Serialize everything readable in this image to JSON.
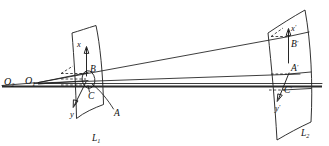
{
  "figure": {
    "kind": "optical-ray-diagram",
    "background_color": "#ffffff",
    "ink_color": "#1b1b1b"
  },
  "labels": {
    "center_far": {
      "base": "O",
      "sub": "2"
    },
    "center_near": {
      "base": "O",
      "sub": "1"
    },
    "surface_left": {
      "base": "L",
      "sub": "1"
    },
    "surface_right": {
      "base": "L",
      "sub": "2"
    },
    "object_axis_x": "x",
    "object_axis_y": "y",
    "image_axis_x": {
      "base": "x",
      "prime": "′"
    },
    "image_axis_y": {
      "base": "y",
      "prime": "′"
    },
    "object_point_a": "A",
    "object_point_b": "B",
    "object_point_c": "C",
    "image_point_a": {
      "base": "A",
      "prime": "′"
    },
    "image_point_b": {
      "base": "B",
      "prime": "′"
    },
    "image_point_c": {
      "base": "C",
      "prime": "′"
    }
  },
  "geometry": {
    "surface_left_outline": "M 72,33 C 79,31 88,28 96,26 C 101,46 104,76 104,104 C 95,107 85,112 77,118 C 76,89 74,58 72,33 Z",
    "surface_right_outline": "M 269,33 C 281,26 293,18 305,11 C 311,44 313,85 311,122 C 299,128 288,134 277,140 C 275,104 272,66 269,33 Z",
    "rays": [
      "M 38,82 L 280,36",
      "M 38,82 L 292,74",
      "M 38,83 L 90,80"
    ],
    "thick_axis": "M 2,86 L 322,86",
    "object_ellipse": {
      "cx": 88,
      "cy": 79,
      "rx": 6.5,
      "ry": 9.0,
      "rotation": -8
    },
    "axis_x_left": {
      "x1": 81,
      "y1": 76,
      "x2": 86,
      "y2": 45
    },
    "axis_y_left": {
      "x1": 86,
      "y1": 81,
      "x2": 74,
      "y2": 106
    },
    "axis_x_right": {
      "x1": 287,
      "y1": 62,
      "x2": 289,
      "y2": 27
    },
    "axis_y_right": {
      "x1": 289,
      "y1": 72,
      "x2": 278,
      "y2": 100
    },
    "dashes_left": [
      "M 62,73 L 86,73",
      "M 62,79 L 86,79",
      "M 62,85 L 86,85"
    ],
    "dashes_right": [
      "M 272,36 L 288,36",
      "M 272,74 L 288,74",
      "M 272,90 L 288,90"
    ]
  },
  "positions": {
    "center_far": {
      "x": 5,
      "y": 82
    },
    "center_near": {
      "x": 26,
      "y": 81
    },
    "surface_left": {
      "x": 95,
      "y": 139
    },
    "surface_right": {
      "x": 304,
      "y": 134
    },
    "object_axis_x": {
      "x": 79,
      "y": 44
    },
    "object_axis_y": {
      "x": 72,
      "y": 115
    },
    "image_axis_x": {
      "x": 292,
      "y": 28
    },
    "image_axis_y": {
      "x": 277,
      "y": 109
    },
    "object_point_a": {
      "x": 116,
      "y": 113
    },
    "object_point_b": {
      "x": 92,
      "y": 70
    },
    "object_point_c": {
      "x": 90,
      "y": 96
    },
    "image_point_a": {
      "x": 292,
      "y": 72
    },
    "image_point_b": {
      "x": 292,
      "y": 44
    },
    "image_point_c": {
      "x": 284,
      "y": 92
    }
  }
}
